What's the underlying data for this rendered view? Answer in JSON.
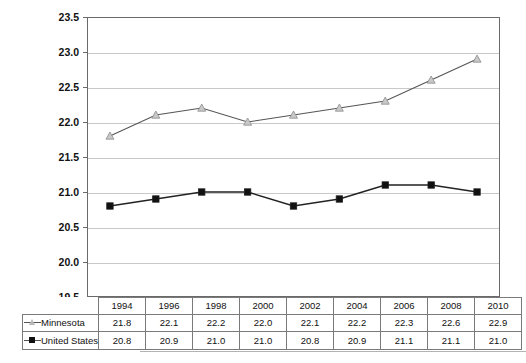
{
  "chart_data": {
    "type": "line",
    "title": "",
    "xlabel": "",
    "ylabel": "",
    "categories": [
      "1994",
      "1996",
      "1998",
      "2000",
      "2002",
      "2004",
      "2006",
      "2008",
      "2010"
    ],
    "ylim": [
      19.5,
      23.5
    ],
    "ytick_step": 0.5,
    "yticks": [
      "19.5",
      "20.0",
      "20.5",
      "21.0",
      "21.5",
      "22.0",
      "22.5",
      "23.0",
      "23.5"
    ],
    "grid": true,
    "legend_position": "table-left",
    "series": [
      {
        "name": "Minnesota",
        "marker": "triangle-open",
        "color": "#555555",
        "marker_fill": "#c8c8c8",
        "values": [
          21.8,
          22.1,
          22.2,
          22.0,
          22.1,
          22.2,
          22.3,
          22.6,
          22.9
        ]
      },
      {
        "name": "United States",
        "marker": "square-filled",
        "color": "#222222",
        "marker_fill": "#111111",
        "values": [
          20.8,
          20.9,
          21.0,
          21.0,
          20.8,
          20.9,
          21.1,
          21.1,
          21.0
        ]
      }
    ]
  },
  "table": {
    "legend_blank": "",
    "header_cells": [
      "1994",
      "1996",
      "1998",
      "2000",
      "2002",
      "2004",
      "2006",
      "2008",
      "2010"
    ],
    "rows": [
      {
        "label": "Minnesota",
        "marker": "triangle-open-icon",
        "cells": [
          "21.8",
          "22.1",
          "22.2",
          "22.0",
          "22.1",
          "22.2",
          "22.3",
          "22.6",
          "22.9"
        ]
      },
      {
        "label": "United States",
        "marker": "square-filled-icon",
        "cells": [
          "20.8",
          "20.9",
          "21.0",
          "21.0",
          "20.8",
          "20.9",
          "21.1",
          "21.1",
          "21.0"
        ]
      }
    ]
  },
  "colors": {
    "minnesota_line": "#555555",
    "united_states_line": "#222222",
    "gridline": "#c9c9c9",
    "frame": "#6a6a6a",
    "text": "#111111"
  }
}
